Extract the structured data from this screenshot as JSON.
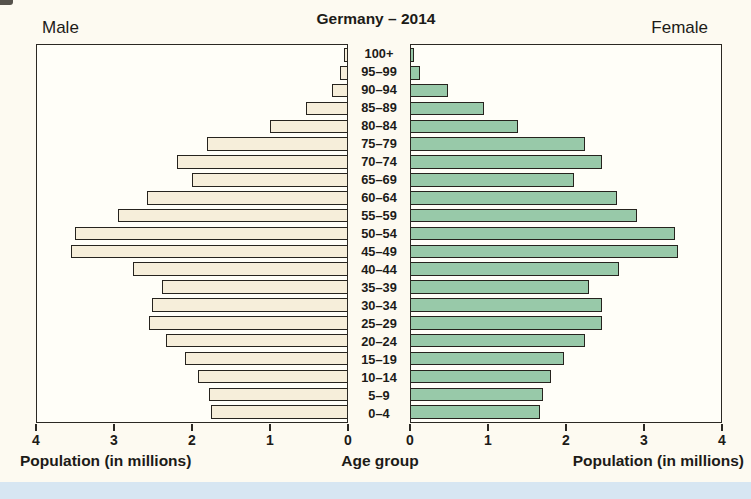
{
  "page": {
    "title": "Germany – 2014",
    "male_label": "Male",
    "female_label": "Female"
  },
  "colors": {
    "page_bg": "#fdfaf1",
    "panel_bg": "#fffef8",
    "male_bar_fill": "#f6eeda",
    "female_bar_fill": "#98c9a9",
    "bar_border": "#26231e",
    "panel_border": "#2b2823",
    "text": "#1c1b18",
    "bottom_strip": "#d7e6f2"
  },
  "chart_data": {
    "type": "bar",
    "subtype": "population-pyramid",
    "title": "Germany – 2014",
    "unit": "millions of people",
    "xlabel_left": "Population (in millions)",
    "xlabel_center": "Age group",
    "xlabel_right": "Population (in millions)",
    "xlim": [
      0,
      4
    ],
    "x_ticks_male_left_to_right": [
      "4",
      "3",
      "2",
      "1",
      "0"
    ],
    "x_ticks_female_left_to_right": [
      "0",
      "1",
      "2",
      "3",
      "4"
    ],
    "categories_top_to_bottom": [
      "100+",
      "95–99",
      "90–94",
      "85–89",
      "80–84",
      "75–79",
      "70–74",
      "65–69",
      "60–64",
      "55–59",
      "50–54",
      "45–49",
      "40–44",
      "35–39",
      "30–34",
      "25–29",
      "20–24",
      "15–19",
      "10–14",
      "5–9",
      "0–4"
    ],
    "series": [
      {
        "name": "Male",
        "side": "left",
        "values_top_to_bottom": [
          0.04,
          0.09,
          0.2,
          0.53,
          1.0,
          1.81,
          2.2,
          2.0,
          2.58,
          2.95,
          3.51,
          3.56,
          2.76,
          2.39,
          2.51,
          2.55,
          2.33,
          2.09,
          1.92,
          1.78,
          1.76
        ]
      },
      {
        "name": "Female",
        "side": "right",
        "values_top_to_bottom": [
          0.04,
          0.12,
          0.48,
          0.94,
          1.38,
          2.24,
          2.46,
          2.1,
          2.66,
          2.92,
          3.4,
          3.44,
          2.68,
          2.3,
          2.46,
          2.46,
          2.25,
          1.97,
          1.8,
          1.7,
          1.66
        ]
      }
    ],
    "grid": false,
    "legend": "none"
  }
}
